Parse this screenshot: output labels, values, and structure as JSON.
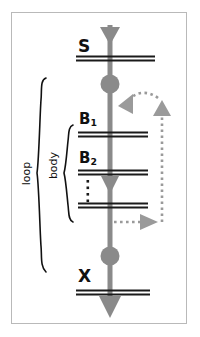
{
  "figure": {
    "background_color": "#ffffff",
    "frame_color": "#b9b9b9",
    "spine_color": "#8a8a8a",
    "line_color": "#1a1a1a",
    "text_color": "#111111",
    "dotted_color": "#9a9a9a"
  },
  "labels": {
    "s": "S",
    "b1_base": "B",
    "b1_sub": "1",
    "b2_base": "B",
    "b2_sub": "2",
    "x": "X",
    "loop": "loop",
    "body": "body"
  },
  "nodes": [
    {
      "id": "bar-s",
      "kind": "double-bar",
      "label": "S",
      "y": 58,
      "x1": 76,
      "x2": 155
    },
    {
      "id": "dot-1",
      "kind": "circle",
      "label": "",
      "y": 84,
      "r": 9
    },
    {
      "id": "bar-b1",
      "kind": "double-bar",
      "label": "B1",
      "y": 134,
      "x1": 78,
      "x2": 148
    },
    {
      "id": "bar-b2",
      "kind": "double-bar",
      "label": "B2",
      "y": 172,
      "x1": 78,
      "x2": 148
    },
    {
      "id": "ellipsis",
      "kind": "vertical-ellipsis",
      "label": "",
      "y": 190,
      "x": 88,
      "dots": 4
    },
    {
      "id": "bar-n",
      "kind": "double-bar",
      "label": "",
      "y": 205,
      "x1": 78,
      "x2": 148
    },
    {
      "id": "dot-2",
      "kind": "circle",
      "label": "",
      "y": 256,
      "r": 9
    },
    {
      "id": "bar-x",
      "kind": "double-bar",
      "label": "X",
      "y": 292,
      "x1": 76,
      "x2": 150
    }
  ],
  "spine": {
    "x": 110,
    "top": 25,
    "bottom": 314,
    "width": 5,
    "arrowheads_y": [
      36,
      182,
      306
    ]
  },
  "brackets": [
    {
      "id": "loop-brace",
      "label": "loop",
      "top": 78,
      "bottom": 272,
      "x": 42
    },
    {
      "id": "body-brace",
      "label": "body",
      "top": 125,
      "bottom": 222,
      "x": 69
    }
  ],
  "dotted_paths": [
    {
      "id": "loopback-upper",
      "style": "dotted",
      "from": "right-rail-top",
      "to": "spine-upper",
      "arrowheads": [
        "left-pointing",
        "up-pointing"
      ]
    },
    {
      "id": "loopback-lower",
      "style": "dotted",
      "from": "spine-lower",
      "to": "right-rail-bottom",
      "arrowheads": [
        "right-pointing"
      ]
    }
  ]
}
